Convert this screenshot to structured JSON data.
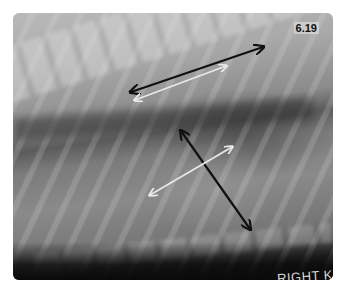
{
  "figure": {
    "label": "6.19",
    "marker_text": "RIGHT K"
  },
  "arrows": [
    {
      "name": "vertebral-length-arrow",
      "color": "#111111",
      "x1": 131,
      "y1": 92,
      "x2": 263,
      "y2": 47
    },
    {
      "name": "vertebral-reference-arrow",
      "color": "#e8e8e8",
      "x1": 135,
      "y1": 100,
      "x2": 226,
      "y2": 66
    },
    {
      "name": "cardiac-long-axis-arrow",
      "color": "#111111",
      "x1": 181,
      "y1": 131,
      "x2": 250,
      "y2": 229
    },
    {
      "name": "cardiac-short-axis-arrow",
      "color": "#e8e8e8",
      "x1": 150,
      "y1": 195,
      "x2": 232,
      "y2": 147
    }
  ],
  "colors": {
    "background": "#ffffff",
    "black_arrow": "#111111",
    "white_arrow": "#e8e8e8"
  }
}
